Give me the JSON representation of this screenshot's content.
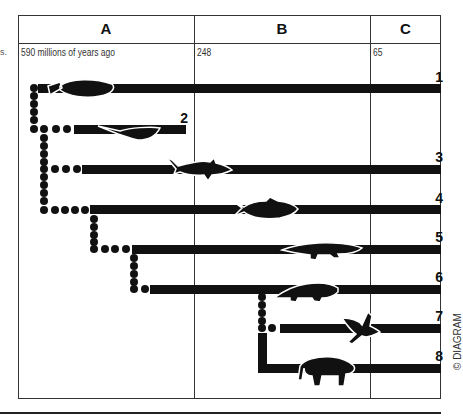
{
  "columns": [
    {
      "label": "A"
    },
    {
      "label": "B"
    },
    {
      "label": "C"
    }
  ],
  "time_labels": {
    "start": "590 millions of years ago",
    "mid": "248",
    "end": "65"
  },
  "side_mark": "s.",
  "rows": [
    {
      "number": "1",
      "creature": "fish-jawless"
    },
    {
      "number": "2",
      "creature": "armored-fish"
    },
    {
      "number": "3",
      "creature": "shark"
    },
    {
      "number": "4",
      "creature": "bony-fish"
    },
    {
      "number": "5",
      "creature": "amphibian"
    },
    {
      "number": "6",
      "creature": "reptile"
    },
    {
      "number": "7",
      "creature": "bird"
    },
    {
      "number": "8",
      "creature": "mammal"
    }
  ],
  "copyright": "© DIAGRAM",
  "colors": {
    "ink": "#111111",
    "frame": "#333333",
    "background": "#ffffff"
  }
}
